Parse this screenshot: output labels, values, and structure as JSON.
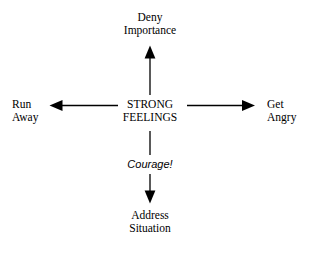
{
  "diagram": {
    "background_color": "#ffffff",
    "stroke_color": "#000000",
    "center": {
      "line1": "STRONG",
      "line2": "FEELINGS"
    },
    "top": {
      "line1": "Deny",
      "line2": "Importance"
    },
    "bottom": {
      "line1": "Address",
      "line2": "Situation"
    },
    "left": {
      "line1": "Run",
      "line2": "Away"
    },
    "right": {
      "line1": "Get",
      "line2": "Angry"
    },
    "edges": [
      {
        "name": "arrow-up",
        "from": "STRONG FEELINGS",
        "to": "Deny Importance",
        "label": ""
      },
      {
        "name": "arrow-left",
        "from": "STRONG FEELINGS",
        "to": "Run Away",
        "label": ""
      },
      {
        "name": "arrow-right",
        "from": "STRONG FEELINGS",
        "to": "Get Angry",
        "label": ""
      },
      {
        "name": "arrow-down",
        "from": "STRONG FEELINGS",
        "to": "Address Situation",
        "label": "Courage!"
      }
    ],
    "edge_label_courage": "Courage!"
  }
}
